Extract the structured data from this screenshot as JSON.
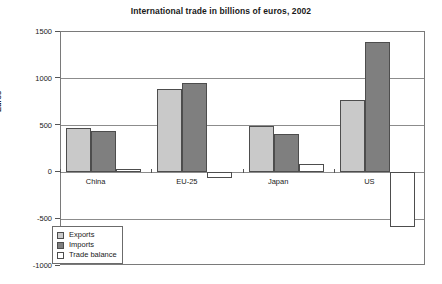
{
  "chart_data": {
    "type": "bar",
    "title": "International trade in billions of euros, 2002",
    "xlabel": "",
    "ylabel": "Euros",
    "ylim": [
      -1000,
      1500
    ],
    "yticks": [
      1500,
      1000,
      500,
      0,
      -500,
      -1000
    ],
    "ytick_labels": [
      "1500",
      "1000",
      "500",
      "0",
      "-500",
      "-1000"
    ],
    "grid": true,
    "legend_position": "bottom-left",
    "categories": [
      "China",
      "EU-25",
      "Japan",
      "US"
    ],
    "series": [
      {
        "name": "Exports",
        "color": "#c9c9c9",
        "values": [
          475,
          890,
          500,
          775
        ]
      },
      {
        "name": "Imports",
        "color": "#7f7f7f",
        "values": [
          440,
          950,
          410,
          1390
        ]
      },
      {
        "name": "Trade balance",
        "color": "#ffffff",
        "values": [
          35,
          -60,
          95,
          -585
        ]
      }
    ]
  },
  "legend": {
    "items": [
      {
        "label": "Exports"
      },
      {
        "label": "Imports"
      },
      {
        "label": "Trade balance"
      }
    ]
  }
}
